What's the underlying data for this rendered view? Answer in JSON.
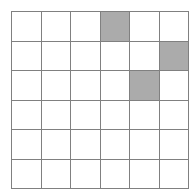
{
  "figure": {
    "name": "shaded-cell-grid",
    "type": "grid",
    "rows": 6,
    "columns": 6,
    "background_color": "#ffffff",
    "gridline_color": "#808080",
    "shaded_color": "#ababab",
    "unshaded_color": "#ffffff",
    "shaded_count": 3,
    "total_cells": 36,
    "shaded_cells": [
      {
        "row": 0,
        "column": 3
      },
      {
        "row": 1,
        "column": 5
      },
      {
        "row": 2,
        "column": 4
      }
    ],
    "cells": [
      [
        0,
        0,
        0,
        1,
        0,
        0
      ],
      [
        0,
        0,
        0,
        0,
        0,
        1
      ],
      [
        0,
        0,
        0,
        0,
        1,
        0
      ],
      [
        0,
        0,
        0,
        0,
        0,
        0
      ],
      [
        0,
        0,
        0,
        0,
        0,
        0
      ],
      [
        0,
        0,
        0,
        0,
        0,
        0
      ]
    ]
  }
}
